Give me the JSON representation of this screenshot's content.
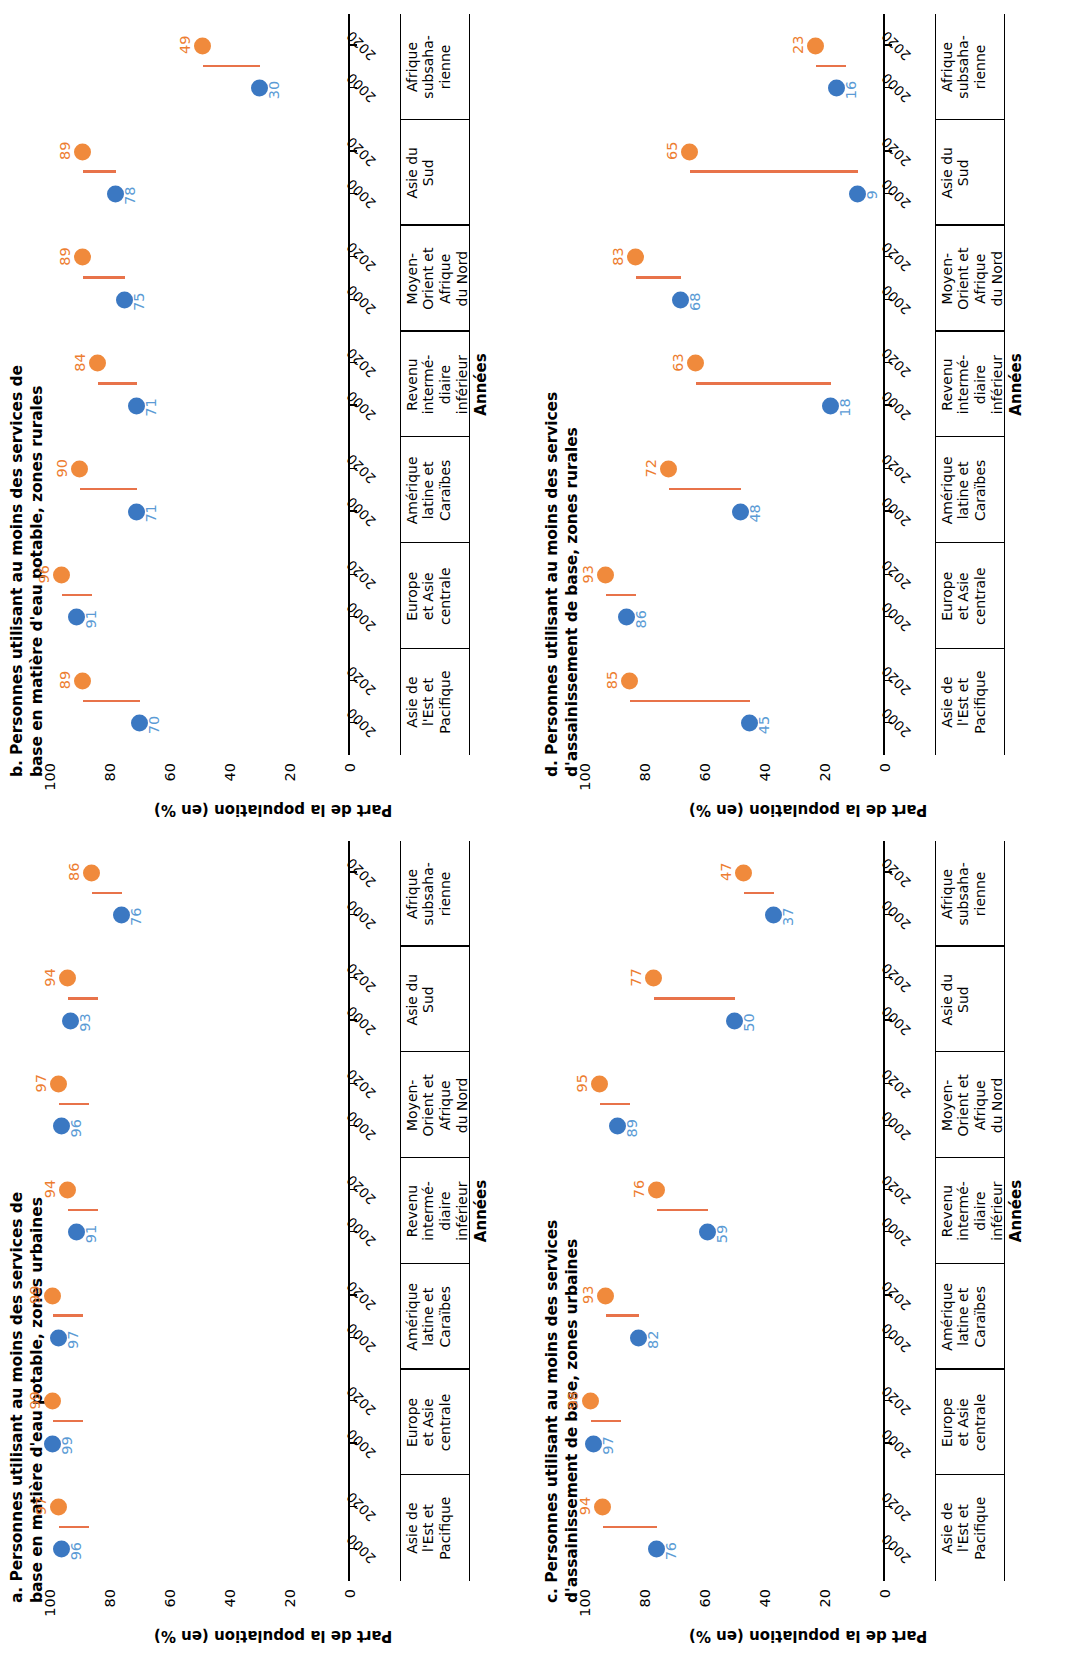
{
  "figure": {
    "ylabel": "Part de la population (en %)",
    "xlabel": "Années",
    "yticks": [
      "100",
      "80",
      "60",
      "40",
      "20",
      "0"
    ],
    "year_early": "2000",
    "year_late": "2020",
    "colors": {
      "series_2000": "#3b78c2",
      "series_2020": "#f08a3c",
      "connector": "#e8734a",
      "label_2000": "#5b9bd5",
      "label_2020": "#ed7d31"
    }
  },
  "categories": [
    "Asie de l'Est et Pacifique",
    "Europe et Asie centrale",
    "Amérique latine et Caraïbes",
    "Revenu intermédiaire inférieur",
    "Moyen-Orient et Afrique du Nord",
    "Asie du Sud",
    "Afrique subsaha-rienne"
  ],
  "categories_lines": [
    [
      "Asie de",
      "l'Est et",
      "Pacifique"
    ],
    [
      "Europe",
      "et Asie",
      "centrale"
    ],
    [
      "Amérique",
      "latine et",
      "Caraïbes"
    ],
    [
      "Revenu",
      "intermé-",
      "diaire",
      "inférieur"
    ],
    [
      "Moyen-",
      "Orient et",
      "Afrique",
      "du Nord"
    ],
    [
      "Asie du",
      "Sud"
    ],
    [
      "Afrique",
      "subsaha-",
      "rienne"
    ]
  ],
  "chart_data": [
    {
      "id": "a",
      "type": "line",
      "title": "a. Personnes utilisant au moins des services de base en matière d'eau potable, zones urbaines",
      "title_lines": [
        "a. Personnes utilisant au moins des services de",
        "base en matière d'eau potable, zones urbaines"
      ],
      "xlabel": "Années",
      "ylabel": "Part de la population (en %)",
      "ylim": [
        0,
        100
      ],
      "grid": false,
      "legend": "none",
      "categories": [
        "Asie de l'Est et Pacifique",
        "Europe et Asie centrale",
        "Amérique latine et Caraïbes",
        "Revenu intermédiaire inférieur",
        "Moyen-Orient et Afrique du Nord",
        "Asie du Sud",
        "Afrique subsaharienne"
      ],
      "series": [
        {
          "name": "2000",
          "values": [
            96,
            99,
            97,
            91,
            96,
            93,
            76
          ]
        },
        {
          "name": "2020",
          "values": [
            97,
            99,
            99,
            94,
            97,
            94,
            86
          ]
        }
      ]
    },
    {
      "id": "b",
      "type": "line",
      "title": "b. Personnes utilisant au moins des services de base en matière d'eau potable, zones rurales",
      "title_lines": [
        "b. Personnes utilisant au moins des services de",
        "base en matière d'eau potable, zones rurales"
      ],
      "xlabel": "Années",
      "ylabel": "Part de la population (en %)",
      "ylim": [
        0,
        100
      ],
      "grid": false,
      "legend": "none",
      "categories": [
        "Asie de l'Est et Pacifique",
        "Europe et Asie centrale",
        "Amérique latine et Caraïbes",
        "Revenu intermédiaire inférieur",
        "Moyen-Orient et Afrique du Nord",
        "Asie du Sud",
        "Afrique subsaharienne"
      ],
      "series": [
        {
          "name": "2000",
          "values": [
            70,
            91,
            71,
            71,
            75,
            78,
            30
          ]
        },
        {
          "name": "2020",
          "values": [
            89,
            96,
            90,
            84,
            89,
            89,
            49
          ]
        }
      ]
    },
    {
      "id": "c",
      "type": "line",
      "title": "c. Personnes utilisant au moins des services d'assainissement de base, zones urbaines",
      "title_lines": [
        "c. Personnes utilisant au moins des services",
        "d'assainissement de base, zones urbaines"
      ],
      "xlabel": "Années",
      "ylabel": "Part de la population (en %)",
      "ylim": [
        0,
        100
      ],
      "grid": false,
      "legend": "none",
      "categories": [
        "Asie de l'Est et Pacifique",
        "Europe et Asie centrale",
        "Amérique latine et Caraïbes",
        "Revenu intermédiaire inférieur",
        "Moyen-Orient et Afrique du Nord",
        "Asie du Sud",
        "Afrique subsaharienne"
      ],
      "series": [
        {
          "name": "2000",
          "values": [
            76,
            97,
            82,
            59,
            89,
            50,
            37
          ]
        },
        {
          "name": "2020",
          "values": [
            94,
            98,
            93,
            76,
            95,
            77,
            47
          ]
        }
      ]
    },
    {
      "id": "d",
      "type": "line",
      "title": "d. Personnes utilisant au moins des services d'assainissement de base, zones rurales",
      "title_lines": [
        "d. Personnes utilisant au moins des services",
        "d'assainissement de base, zones rurales"
      ],
      "xlabel": "Années",
      "ylabel": "Part de la population (en %)",
      "ylim": [
        0,
        100
      ],
      "grid": false,
      "legend": "none",
      "categories": [
        "Asie de l'Est et Pacifique",
        "Europe et Asie centrale",
        "Amérique latine et Caraïbes",
        "Revenu intermédiaire inférieur",
        "Moyen-Orient et Afrique du Nord",
        "Asie du Sud",
        "Afrique subsaharienne"
      ],
      "series": [
        {
          "name": "2000",
          "values": [
            45,
            86,
            48,
            18,
            68,
            9,
            16
          ]
        },
        {
          "name": "2020",
          "values": [
            85,
            93,
            72,
            63,
            83,
            65,
            23
          ]
        }
      ]
    }
  ]
}
